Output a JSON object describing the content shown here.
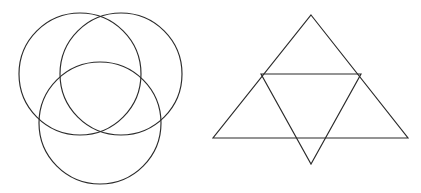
{
  "canvas": {
    "width": 421,
    "height": 193,
    "background_color": "#ffffff",
    "stroke_color": "#2b2b2b",
    "stroke_width": 1.15
  },
  "figures": [
    {
      "id": "three-overlapping-circles",
      "name": "Three Overlapping Circles",
      "type": "circles",
      "description": "Three equal circles arranged in a triangular Venn-like pattern: two on top side by side and one centered below, all mutually overlapping at a common central region.",
      "count": 3,
      "radius": 61,
      "shapes": [
        {
          "name": "top-left-circle",
          "cx": 80,
          "cy": 74,
          "r": 61
        },
        {
          "name": "top-right-circle",
          "cx": 121,
          "cy": 74,
          "r": 61
        },
        {
          "name": "bottom-center-circle",
          "cx": 100,
          "cy": 123,
          "r": 61
        }
      ]
    },
    {
      "id": "two-overlapping-triangles",
      "name": "Two Overlapping Triangles",
      "type": "triangles",
      "description": "A large upward-pointing triangle overlapped by a smaller downward-pointing triangle whose top edge is a horizontal chord across the large triangle and whose apex extends below the base.",
      "count": 2,
      "shapes": [
        {
          "name": "upward-triangle",
          "orientation": "up",
          "points": "311,15 408,138 213,138",
          "vertices": [
            {
              "label": "apex",
              "x": 311,
              "y": 15
            },
            {
              "label": "bottom-right",
              "x": 408,
              "y": 138
            },
            {
              "label": "bottom-left",
              "x": 213,
              "y": 138
            }
          ]
        },
        {
          "name": "downward-triangle",
          "orientation": "down",
          "points": "261,74 361,74 311,164",
          "vertices": [
            {
              "label": "top-left",
              "x": 261,
              "y": 74
            },
            {
              "label": "top-right",
              "x": 361,
              "y": 74
            },
            {
              "label": "bottom-apex",
              "x": 311,
              "y": 164
            }
          ]
        }
      ]
    }
  ]
}
